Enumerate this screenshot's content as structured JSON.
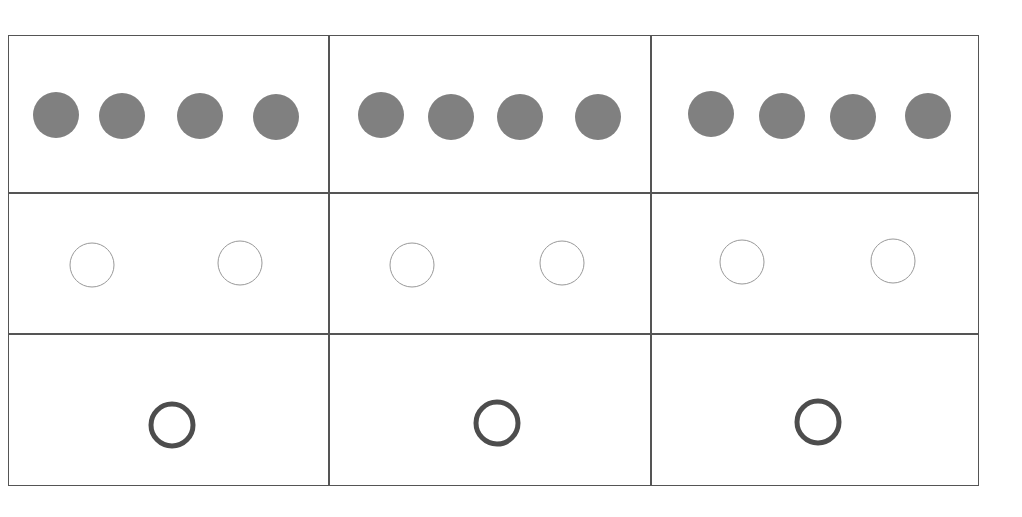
{
  "figure": {
    "title": "Three-by-three grid of circle groups",
    "background_color": "#ffffff",
    "grid": {
      "border_color": "#555555",
      "border_width_px": 2,
      "inner_line_color": "#555555",
      "inner_line_width_px": 2,
      "x": 8,
      "y": 35,
      "width": 971,
      "height": 451,
      "columns": 3,
      "rows": 3,
      "column_edges": [
        8,
        329,
        651,
        979
      ],
      "row_edges": [
        35,
        193,
        334,
        486
      ]
    },
    "legend": {
      "filled_label": "filled-gray-circle",
      "thin_outline_label": "thin-outline-circle",
      "thick_outline_label": "thick-ring-circle"
    }
  },
  "chart_data": {
    "type": "scatter",
    "title": "Three-by-three grid of circle groups",
    "xlabel": "",
    "ylabel": "",
    "xlim": [
      8,
      979
    ],
    "ylim": [
      35,
      486
    ],
    "grid": true,
    "legend_position": "none",
    "categories": [
      "column-1",
      "column-2",
      "column-3"
    ],
    "series": [
      {
        "name": "row-1-filled-circles",
        "marker": "filled-circle",
        "fill_color": "#808080",
        "stroke_color": "#808080",
        "stroke_width": 0,
        "diameter": 46,
        "count_per_cell": 4,
        "values": [
          4,
          4,
          4
        ],
        "points": [
          {
            "cell": "r1c1",
            "x": 56,
            "y": 115
          },
          {
            "cell": "r1c1",
            "x": 122,
            "y": 116
          },
          {
            "cell": "r1c1",
            "x": 200,
            "y": 116
          },
          {
            "cell": "r1c1",
            "x": 276,
            "y": 117
          },
          {
            "cell": "r1c2",
            "x": 381,
            "y": 115
          },
          {
            "cell": "r1c2",
            "x": 451,
            "y": 117
          },
          {
            "cell": "r1c2",
            "x": 520,
            "y": 117
          },
          {
            "cell": "r1c2",
            "x": 598,
            "y": 117
          },
          {
            "cell": "r1c3",
            "x": 711,
            "y": 114
          },
          {
            "cell": "r1c3",
            "x": 782,
            "y": 116
          },
          {
            "cell": "r1c3",
            "x": 853,
            "y": 117
          },
          {
            "cell": "r1c3",
            "x": 928,
            "y": 116
          }
        ]
      },
      {
        "name": "row-2-thin-outline-circles",
        "marker": "open-circle",
        "fill_color": "#ffffff",
        "stroke_color": "#999999",
        "stroke_width": 1,
        "diameter": 45,
        "count_per_cell": 2,
        "values": [
          2,
          2,
          2
        ],
        "points": [
          {
            "cell": "r2c1",
            "x": 92,
            "y": 265
          },
          {
            "cell": "r2c1",
            "x": 240,
            "y": 263
          },
          {
            "cell": "r2c2",
            "x": 412,
            "y": 265
          },
          {
            "cell": "r2c2",
            "x": 562,
            "y": 263
          },
          {
            "cell": "r2c3",
            "x": 742,
            "y": 262
          },
          {
            "cell": "r2c3",
            "x": 893,
            "y": 261
          }
        ]
      },
      {
        "name": "row-3-thick-ring-circles",
        "marker": "ring",
        "fill_color": "#ffffff",
        "stroke_color": "#4d4d4d",
        "stroke_width": 5,
        "diameter": 47,
        "count_per_cell": 1,
        "values": [
          1,
          1,
          1
        ],
        "points": [
          {
            "cell": "r3c1",
            "x": 172,
            "y": 425
          },
          {
            "cell": "r3c2",
            "x": 497,
            "y": 423
          },
          {
            "cell": "r3c3",
            "x": 818,
            "y": 422
          }
        ]
      }
    ]
  }
}
